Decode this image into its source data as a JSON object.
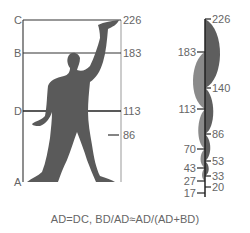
{
  "figure": {
    "left_panel": {
      "corner_labels": {
        "A": "A",
        "B": "B",
        "C": "C",
        "D": "D"
      },
      "height_labels": [
        {
          "value": "226",
          "y": 20
        },
        {
          "value": "183",
          "y": 53
        },
        {
          "value": "113",
          "y": 110
        },
        {
          "value": "86",
          "y": 135
        }
      ]
    },
    "right_panel": {
      "left_ticks": [
        {
          "value": "183",
          "y": 52
        },
        {
          "value": "113",
          "y": 109
        },
        {
          "value": "70",
          "y": 149
        },
        {
          "value": "43",
          "y": 168
        },
        {
          "value": "27",
          "y": 181
        },
        {
          "value": "17",
          "y": 193
        }
      ],
      "right_ticks": [
        {
          "value": "226",
          "y": 19
        },
        {
          "value": "140",
          "y": 88
        },
        {
          "value": "86",
          "y": 134
        },
        {
          "value": "53",
          "y": 161
        },
        {
          "value": "33",
          "y": 176
        },
        {
          "value": "20",
          "y": 187
        }
      ]
    },
    "formula": "AD=DC, BD/AD≈AD/(AD+BD)",
    "colors": {
      "silhouette": "#5a5a5a",
      "red_series": "#5e5e5e",
      "blue_series": "#8a8a8a",
      "line": "#333333"
    }
  }
}
